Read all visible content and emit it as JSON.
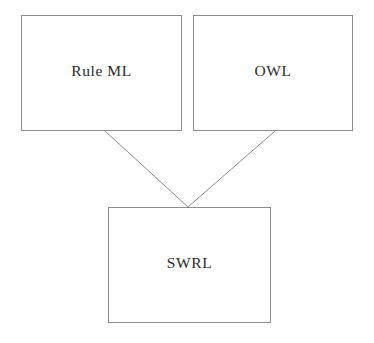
{
  "diagram": {
    "canvas": {
      "width": 374,
      "height": 343,
      "background": "#ffffff"
    },
    "stroke_color": "#8d8d8d",
    "text_color": "#2b2b2b",
    "nodes": [
      {
        "id": "ruleml",
        "label": "Rule ML",
        "x": 21,
        "y": 15,
        "w": 161,
        "h": 116
      },
      {
        "id": "owl",
        "label": "OWL",
        "x": 193,
        "y": 15,
        "w": 160,
        "h": 116
      },
      {
        "id": "swrl",
        "label": "SWRL",
        "x": 108,
        "y": 207,
        "w": 163,
        "h": 116
      }
    ],
    "edges": [
      {
        "id": "ruleml-to-swrl",
        "from": "ruleml",
        "to": "swrl",
        "x1": 105,
        "y1": 131,
        "x2": 188,
        "y2": 207
      },
      {
        "id": "owl-to-swrl",
        "from": "owl",
        "to": "swrl",
        "x1": 275,
        "y1": 131,
        "x2": 188,
        "y2": 207
      }
    ]
  }
}
